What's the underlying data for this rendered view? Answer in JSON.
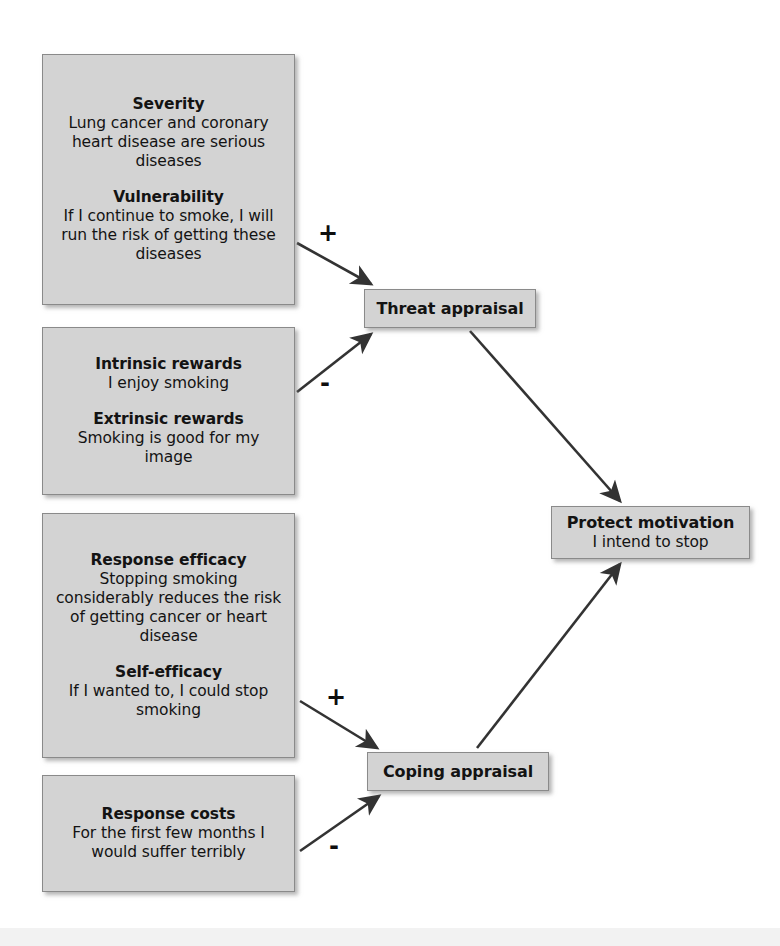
{
  "diagram": {
    "type": "flow-diagram",
    "accent_box_fill": "#d3d3d3",
    "accent_box_border": "#8a8a8a",
    "edge_color": "#333333",
    "background": "#ffffff"
  },
  "nodes": {
    "threat_sources": {
      "groups": [
        {
          "heading": "Severity",
          "body": "Lung cancer and coronary heart disease are serious diseases"
        },
        {
          "heading": "Vulnerability",
          "body": "If I continue to smoke, I will run the risk of getting these diseases"
        }
      ]
    },
    "rewards": {
      "groups": [
        {
          "heading": "Intrinsic rewards",
          "body": "I enjoy smoking"
        },
        {
          "heading": "Extrinsic rewards",
          "body": "Smoking is good for my image"
        }
      ]
    },
    "efficacy": {
      "groups": [
        {
          "heading": "Response efficacy",
          "body": "Stopping smoking considerably reduces the risk of getting cancer or heart disease"
        },
        {
          "heading": "Self-efficacy",
          "body": "If I wanted to, I could stop smoking"
        }
      ]
    },
    "costs": {
      "groups": [
        {
          "heading": "Response costs",
          "body": "For the first few months I would suffer terribly"
        }
      ]
    },
    "threat_appraisal": {
      "heading": "Threat appraisal"
    },
    "coping_appraisal": {
      "heading": "Coping appraisal"
    },
    "protect_motivation": {
      "heading": "Protect motivation",
      "body": "I intend to stop"
    }
  },
  "edges": [
    {
      "id": "severity-to-threat",
      "from": "threat_sources",
      "to": "threat_appraisal",
      "sign": "+"
    },
    {
      "id": "rewards-to-threat",
      "from": "rewards",
      "to": "threat_appraisal",
      "sign": "-"
    },
    {
      "id": "efficacy-to-coping",
      "from": "efficacy",
      "to": "coping_appraisal",
      "sign": "+"
    },
    {
      "id": "costs-to-coping",
      "from": "costs",
      "to": "coping_appraisal",
      "sign": "-"
    },
    {
      "id": "threat-to-motivation",
      "from": "threat_appraisal",
      "to": "protect_motivation",
      "sign": ""
    },
    {
      "id": "coping-to-motivation",
      "from": "coping_appraisal",
      "to": "protect_motivation",
      "sign": ""
    }
  ]
}
